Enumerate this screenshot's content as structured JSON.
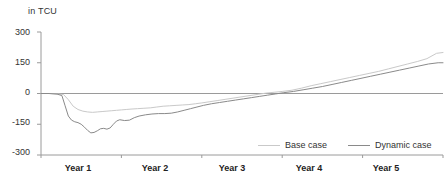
{
  "chart_data": {
    "type": "line",
    "title": "in TCU",
    "xlabel": "",
    "ylabel": "in TCU",
    "ylim": [
      -300,
      300
    ],
    "yticks": [
      300,
      150,
      0,
      -150,
      -300
    ],
    "ytick_labels": [
      "300",
      "150",
      "0",
      "-150",
      "-300"
    ],
    "categories": [
      "Year 1",
      "Year 2",
      "Year 3",
      "Year 4",
      "Year 5"
    ],
    "xtick_labels": [
      "Year 1",
      "Year 2",
      "Year 3",
      "Year 4",
      "Year 5"
    ],
    "grid": false,
    "legend_position": "bottom-right",
    "zero_line": true,
    "series": [
      {
        "name": "Base case",
        "color": "#c9c9c9",
        "x": [
          0.0,
          0.1,
          0.2,
          0.28,
          0.34,
          0.4,
          0.46,
          0.52,
          0.58,
          0.64,
          0.7,
          0.76,
          0.82,
          0.88,
          0.94,
          1.0,
          1.06,
          1.12,
          1.2,
          1.28,
          1.36,
          1.44,
          1.52,
          1.6,
          1.68,
          1.76,
          1.84,
          1.92,
          2.0,
          2.1,
          2.2,
          2.3,
          2.4,
          2.5,
          2.6,
          2.7,
          2.8,
          2.9,
          3.0,
          3.12,
          3.24,
          3.36,
          3.48,
          3.6,
          3.72,
          3.84,
          3.96,
          4.08,
          4.2,
          4.32,
          4.44,
          4.56,
          4.68,
          4.8,
          4.92,
          5.0
        ],
        "values": [
          0,
          0,
          -2,
          -5,
          -30,
          -62,
          -78,
          -86,
          -90,
          -92,
          -90,
          -88,
          -86,
          -84,
          -82,
          -80,
          -78,
          -76,
          -74,
          -72,
          -70,
          -66,
          -62,
          -60,
          -58,
          -56,
          -54,
          -50,
          -46,
          -40,
          -34,
          -28,
          -22,
          -16,
          -10,
          -4,
          2,
          6,
          10,
          16,
          26,
          38,
          48,
          58,
          68,
          78,
          88,
          98,
          108,
          120,
          132,
          144,
          156,
          170,
          196,
          200
        ]
      },
      {
        "name": "Dynamic case",
        "color": "#8a8a8a",
        "x": [
          0.0,
          0.1,
          0.2,
          0.26,
          0.3,
          0.34,
          0.38,
          0.42,
          0.46,
          0.5,
          0.54,
          0.58,
          0.62,
          0.66,
          0.7,
          0.74,
          0.78,
          0.82,
          0.86,
          0.9,
          0.94,
          0.98,
          1.04,
          1.1,
          1.16,
          1.22,
          1.3,
          1.38,
          1.46,
          1.54,
          1.62,
          1.7,
          1.78,
          1.86,
          1.94,
          2.02,
          2.12,
          2.22,
          2.32,
          2.42,
          2.52,
          2.62,
          2.72,
          2.82,
          2.92,
          3.02,
          3.14,
          3.26,
          3.38,
          3.5,
          3.62,
          3.74,
          3.86,
          3.98,
          4.1,
          4.22,
          4.34,
          4.46,
          4.58,
          4.7,
          4.82,
          4.94,
          5.0
        ],
        "values": [
          0,
          0,
          -3,
          -10,
          -60,
          -110,
          -130,
          -138,
          -142,
          -150,
          -164,
          -180,
          -192,
          -190,
          -182,
          -172,
          -170,
          -174,
          -168,
          -150,
          -134,
          -128,
          -132,
          -130,
          -118,
          -110,
          -104,
          -100,
          -98,
          -98,
          -96,
          -90,
          -82,
          -74,
          -66,
          -58,
          -50,
          -44,
          -38,
          -32,
          -26,
          -20,
          -14,
          -8,
          -2,
          4,
          10,
          18,
          26,
          34,
          44,
          54,
          64,
          74,
          84,
          94,
          104,
          114,
          124,
          134,
          144,
          150,
          150
        ]
      }
    ]
  },
  "legend": {
    "items": [
      {
        "label": "Base case",
        "color": "#c9c9c9"
      },
      {
        "label": "Dynamic case",
        "color": "#8a8a8a"
      }
    ]
  },
  "axes": {
    "axis_color": "#9a9a9a",
    "zero_line_color": "#9a9a9a"
  }
}
